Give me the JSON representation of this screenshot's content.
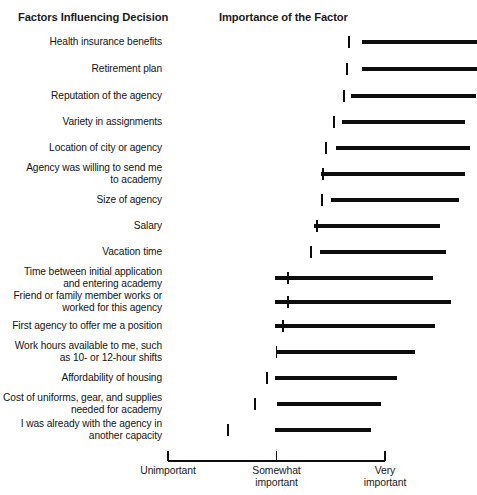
{
  "header": {
    "factors_title": "Factors Influencing Decision",
    "importance_title": "Importance of the Factor"
  },
  "chart_data": {
    "type": "bar",
    "title": "Importance of the Factor",
    "xlabel": "",
    "ylabel": "Factors Influencing Decision",
    "grid": false,
    "legend": null,
    "orientation": "horizontal",
    "xlim": [
      1,
      3
    ],
    "axis_ticks": [
      {
        "value": 1,
        "line1": "Unimportant",
        "line2": ""
      },
      {
        "value": 2,
        "line1": "Somewhat",
        "line2": "important"
      },
      {
        "value": 3,
        "line1": "Very",
        "line2": "important"
      }
    ],
    "note": "Each row shows a horizontal range bar with a vertical tick marking the mean/median value.",
    "categories": [
      "Health insurance benefits",
      "Retirement plan",
      "Reputation of the agency",
      "Variety in assignments",
      "Location of city or agency",
      "Agency was willing to send me to academy",
      "Size of agency",
      "Salary",
      "Vacation time",
      "Time between initial application and entering academy",
      "Friend or family member works or worked for this agency",
      "First agency to offer me a position",
      "Work hours available to me, such as 10- or 12-hour shifts",
      "Affordability of housing",
      "Cost of uniforms, gear, and supplies needed for academy",
      "I was already with the agency in another capacity"
    ],
    "rows": [
      {
        "label_line1": "Health insurance benefits",
        "label_line2": "",
        "start": 2.79,
        "end": 3.85,
        "marker": 2.67
      },
      {
        "label_line1": "Retirement plan",
        "label_line2": "",
        "start": 2.79,
        "end": 3.85,
        "marker": 2.65
      },
      {
        "label_line1": "Reputation of the agency",
        "label_line2": "",
        "start": 2.69,
        "end": 3.84,
        "marker": 2.62
      },
      {
        "label_line1": "Variety in assignments",
        "label_line2": "",
        "start": 2.6,
        "end": 3.74,
        "marker": 2.53
      },
      {
        "label_line1": "Location of city or agency",
        "label_line2": "",
        "start": 2.55,
        "end": 3.78,
        "marker": 2.46
      },
      {
        "label_line1": "Agency was willing to send me",
        "label_line2": "to academy",
        "start": 2.41,
        "end": 3.74,
        "marker": 2.43
      },
      {
        "label_line1": "Size of agency",
        "label_line2": "",
        "start": 2.5,
        "end": 3.68,
        "marker": 2.42
      },
      {
        "label_line1": "Salary",
        "label_line2": "",
        "start": 2.35,
        "end": 3.51,
        "marker": 2.37
      },
      {
        "label_line1": "Vacation time",
        "label_line2": "",
        "start": 2.4,
        "end": 3.56,
        "marker": 2.32
      },
      {
        "label_line1": "Time between initial application",
        "label_line2": "and entering academy",
        "start": 1.99,
        "end": 3.44,
        "marker": 2.11
      },
      {
        "label_line1": "Friend or family member works or",
        "label_line2": "worked for this agency",
        "start": 1.99,
        "end": 3.61,
        "marker": 2.11
      },
      {
        "label_line1": "First agency to offer me a position",
        "label_line2": "",
        "start": 1.99,
        "end": 3.46,
        "marker": 2.06
      },
      {
        "label_line1": "Work hours available to me, such",
        "label_line2": "as 10- or 12-hour shifts",
        "start": 2.0,
        "end": 3.28,
        "marker": 2.0
      },
      {
        "label_line1": "Affordability of housing",
        "label_line2": "",
        "start": 1.99,
        "end": 3.11,
        "marker": 1.91
      },
      {
        "label_line1": "Cost of uniforms, gear, and supplies",
        "label_line2": "needed for academy",
        "start": 2.0,
        "end": 2.96,
        "marker": 1.8
      },
      {
        "label_line1": "I was already with the agency in",
        "label_line2": "another capacity",
        "start": 1.99,
        "end": 2.87,
        "marker": 1.55
      }
    ]
  },
  "colors": {
    "bar": "#0d0d0d",
    "marker": "#0d0d0d",
    "axis": "#0d0d0d",
    "text": "#141414",
    "background": "#ffffff"
  }
}
